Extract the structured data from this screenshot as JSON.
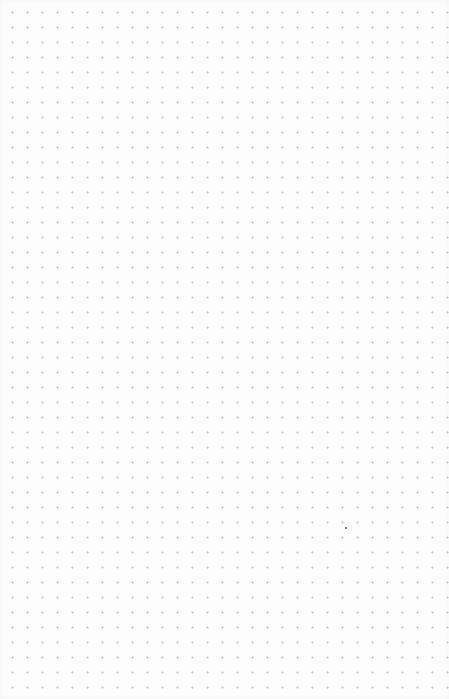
{
  "page": {
    "type": "dot-grid",
    "background_color": "#fdfdfd",
    "dot_color": "#c9c9c9",
    "dot_spacing_px": 15,
    "marks": [
      {
        "x": 345,
        "y": 527,
        "color": "#555555"
      }
    ]
  }
}
